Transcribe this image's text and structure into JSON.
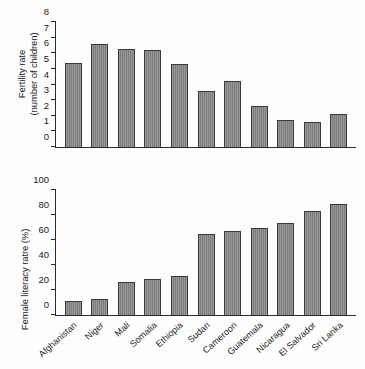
{
  "chart_data": [
    {
      "type": "bar",
      "title": "",
      "panel": "top",
      "xlabel": "",
      "ylabel": "Fertility rate\n(number of children)",
      "ylim": [
        0,
        8
      ],
      "yticks": [
        0,
        1,
        2,
        3,
        4,
        5,
        6,
        7,
        8
      ],
      "ytick_labels": [
        "0",
        "1",
        "2",
        "3",
        "4",
        "5",
        "6",
        "7",
        "8"
      ],
      "grid": false,
      "legend": "none",
      "categories": [
        "Afghanistan",
        "Niger",
        "Mali",
        "Somalia",
        "Ethiopia",
        "Sudan",
        "Cameroon",
        "Guatemala",
        "Nicaragua",
        "El Salvador",
        "Sri Lanka"
      ],
      "values": [
        5.4,
        6.6,
        6.3,
        6.2,
        5.3,
        3.6,
        4.2,
        2.6,
        1.7,
        1.6,
        2.1
      ],
      "bar_color": "#838383",
      "bar_edge_color": "#3a3a3a"
    },
    {
      "type": "bar",
      "title": "",
      "panel": "bottom",
      "xlabel": "",
      "ylabel": "Female literacy ratre (%)",
      "ylim": [
        0,
        100
      ],
      "yticks": [
        0,
        20,
        40,
        60,
        80,
        100
      ],
      "ytick_labels": [
        "0",
        "20",
        "40",
        "60",
        "80",
        "100"
      ],
      "grid": false,
      "legend": "none",
      "categories": [
        "Afghanistan",
        "Niger",
        "Mali",
        "Somalia",
        "Ethiopia",
        "Sudan",
        "Cameroon",
        "Guatemala",
        "Nicaragua",
        "El Salvador",
        "Sri Lanka"
      ],
      "values": [
        11,
        13,
        26.5,
        28.5,
        31.5,
        64.5,
        67,
        69.5,
        74,
        83.5,
        89
      ],
      "bar_color": "#838383",
      "bar_edge_color": "#3a3a3a"
    }
  ]
}
